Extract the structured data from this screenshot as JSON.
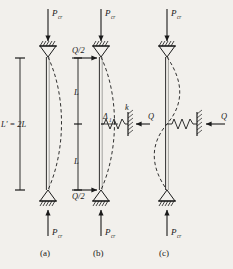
{
  "figure": {
    "title_caption": "Buckling of pin-ended columns with and without elastic lateral restraint",
    "background_color": "#f2f0ec",
    "ink_color": "#1a1a1a",
    "panels": [
      {
        "key": "a",
        "caption": "(a)",
        "load_top_label": "P",
        "load_top_sub": "cr",
        "load_bottom_label": "P",
        "load_bottom_sub": "cr",
        "dimension_label": "L' = 2L",
        "buckled_shape": "single-half-sine",
        "supports": [
          "pin-top",
          "pin-bottom"
        ],
        "lateral_loads": [],
        "springs": []
      },
      {
        "key": "b",
        "caption": "(b)",
        "load_top_label": "P",
        "load_top_sub": "cr",
        "load_bottom_label": "P",
        "load_bottom_sub": "cr",
        "lateral_load_top_label": "Q/2",
        "lateral_load_bottom_label": "Q/2",
        "segment_upper_label": "L",
        "segment_lower_label": "L",
        "deflection_label": "Δ",
        "deflection_sub": "1",
        "buckled_shape": "single-half-sine",
        "supports": [
          "pin-top",
          "pin-bottom"
        ],
        "springs": []
      },
      {
        "key": "c",
        "caption": "(c)",
        "load_top_label": "P",
        "load_top_sub": "cr",
        "load_bottom_label": "P",
        "load_bottom_sub": "cr",
        "spring_stiffness_label": "k",
        "spring_force_left_label": "Q",
        "spring_force_right_label": "Q",
        "buckled_shape": "s-curve",
        "supports": [
          "pin-top",
          "pin-bottom"
        ],
        "springs": [
          "left-spring",
          "right-spring"
        ]
      }
    ],
    "labels": {
      "P_symbol": "P",
      "cr_subscript": "cr",
      "Q_symbol": "Q",
      "Q_half": "Q/2",
      "L_symbol": "L",
      "L_prime_eq_2L": "L' = 2L",
      "delta_symbol": "Δ",
      "delta_subscript": "1",
      "k_symbol": "k",
      "caption_a": "(a)",
      "caption_b": "(b)",
      "caption_c": "(c)"
    }
  }
}
